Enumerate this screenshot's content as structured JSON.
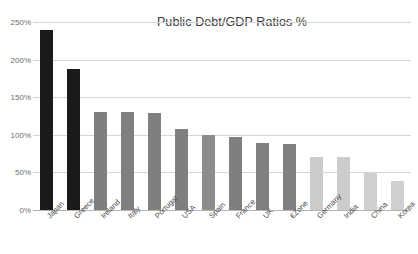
{
  "chart_data": {
    "type": "bar",
    "title": "Public Debt/GDP Ratios %",
    "xlabel": "",
    "ylabel": "",
    "ylim": [
      0,
      250
    ],
    "grid": true,
    "legend": "none",
    "ytick_labels": [
      "250%",
      "200%",
      "150%",
      "100%",
      "50%",
      "0%"
    ],
    "ytick_values": [
      250,
      200,
      150,
      100,
      50,
      0
    ],
    "categories": [
      "Japan",
      "Greece",
      "Ireland",
      "Italy",
      "Portugal",
      "USA",
      "Spain",
      "France",
      "UK",
      "€Zone",
      "Germany",
      "India",
      "China",
      "Korea"
    ],
    "values": [
      240,
      188,
      130,
      130,
      129,
      108,
      100,
      97,
      89,
      88,
      70,
      70,
      49,
      38
    ],
    "bar_colors": [
      "#1a1a1a",
      "#1a1a1a",
      "#7f7f7f",
      "#7f7f7f",
      "#7f7f7f",
      "#7f7f7f",
      "#8c8c8c",
      "#7f7f7f",
      "#808080",
      "#808080",
      "#cccccc",
      "#cccccc",
      "#cfcfcf",
      "#cfcfcf"
    ],
    "colors": {
      "gridline": "#d6d6d6",
      "axis": "#b4b4b4",
      "title_text": "#3a3a3a",
      "tick_text": "#6e6e6e",
      "category_text": "#4a4a4a",
      "background": "#ffffff",
      "dark_bar": "#1a1a1a",
      "mid_bar": "#7f7f7f",
      "light_bar": "#cccccc"
    }
  }
}
